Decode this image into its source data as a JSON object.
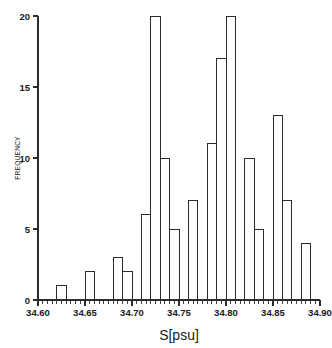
{
  "chart_data": {
    "type": "bar",
    "title": "",
    "subtitle": "",
    "xlabel": "S[psu]",
    "ylabel": "FREQUENCY",
    "xlim": [
      34.6,
      34.9
    ],
    "ylim": [
      0,
      20
    ],
    "bin_width": 0.01,
    "grid": false,
    "legend": null,
    "legend_position": "none",
    "x_major_ticks": [
      34.6,
      34.65,
      34.7,
      34.75,
      34.8,
      34.85,
      34.9
    ],
    "x_major_tick_labels": [
      "34.60",
      "34.65",
      "34.70",
      "34.75",
      "34.80",
      "34.85",
      "34.90"
    ],
    "x_minor_tick_step": 0.005,
    "y_major_ticks": [
      0,
      5,
      10,
      15,
      20
    ],
    "y_major_tick_labels": [
      "0",
      "5",
      "10",
      "15",
      "20"
    ],
    "bin_edges": [
      34.6,
      34.61,
      34.62,
      34.63,
      34.64,
      34.65,
      34.66,
      34.67,
      34.68,
      34.69,
      34.7,
      34.71,
      34.72,
      34.73,
      34.74,
      34.75,
      34.76,
      34.77,
      34.78,
      34.79,
      34.8,
      34.81,
      34.82,
      34.83,
      34.84,
      34.85,
      34.86,
      34.87,
      34.88,
      34.89,
      34.9
    ],
    "categories": [
      "34.60-34.61",
      "34.61-34.62",
      "34.62-34.63",
      "34.63-34.64",
      "34.64-34.65",
      "34.65-34.66",
      "34.66-34.67",
      "34.67-34.68",
      "34.68-34.69",
      "34.69-34.70",
      "34.70-34.71",
      "34.71-34.72",
      "34.72-34.73",
      "34.73-34.74",
      "34.74-34.75",
      "34.75-34.76",
      "34.76-34.77",
      "34.77-34.78",
      "34.78-34.79",
      "34.79-34.80",
      "34.80-34.81",
      "34.81-34.82",
      "34.82-34.83",
      "34.83-34.84",
      "34.84-34.85",
      "34.85-34.86",
      "34.86-34.87",
      "34.87-34.88",
      "34.88-34.89",
      "34.89-34.90"
    ],
    "values": [
      0,
      0,
      1,
      0,
      0,
      2,
      0,
      0,
      3,
      2,
      0,
      6,
      20,
      10,
      5,
      0,
      7,
      0,
      11,
      17,
      20,
      0,
      10,
      5,
      0,
      13,
      7,
      0,
      4,
      0
    ]
  },
  "axes": {
    "x_title": "S[psu]",
    "y_title": "FREQUENCY"
  }
}
